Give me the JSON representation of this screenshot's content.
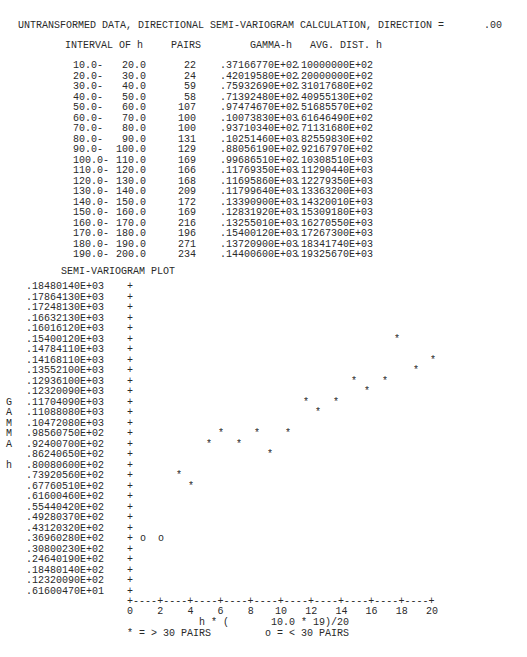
{
  "header": {
    "title": "UNTRANSFORMED DATA, DIRECTIONAL SEMI-VARIOGRAM CALCULATION, DIRECTION =",
    "direction": ".00"
  },
  "table": {
    "columns": [
      "INTERVAL OF h",
      "PAIRS",
      "GAMMA-h",
      "AVG. DIST. h"
    ],
    "rows": [
      {
        "from": "10.0-",
        "to": "20.0",
        "pairs": "22",
        "gamma": ".37166770E+02",
        "dist": ".10000000E+02"
      },
      {
        "from": "20.0-",
        "to": "30.0",
        "pairs": "24",
        "gamma": ".42019580E+02",
        "dist": ".20000000E+02"
      },
      {
        "from": "30.0-",
        "to": "40.0",
        "pairs": "59",
        "gamma": ".75932690E+02",
        "dist": ".31017680E+02"
      },
      {
        "from": "40.0-",
        "to": "50.0",
        "pairs": "58",
        "gamma": ".71392480E+02",
        "dist": ".40955130E+02"
      },
      {
        "from": "50.0-",
        "to": "60.0",
        "pairs": "107",
        "gamma": ".97474670E+02",
        "dist": ".51685570E+02"
      },
      {
        "from": "60.0-",
        "to": "70.0",
        "pairs": "100",
        "gamma": ".10073830E+03",
        "dist": ".61646490E+02"
      },
      {
        "from": "70.0-",
        "to": "80.0",
        "pairs": "100",
        "gamma": ".93710340E+02",
        "dist": ".71131680E+02"
      },
      {
        "from": "80.0-",
        "to": "90.0",
        "pairs": "131",
        "gamma": ".10251460E+03",
        "dist": ".82559830E+02"
      },
      {
        "from": "90.0-",
        "to": "100.0",
        "pairs": "129",
        "gamma": ".88056190E+02",
        "dist": ".92167970E+02"
      },
      {
        "from": "100.0-",
        "to": "110.0",
        "pairs": "169",
        "gamma": ".99686510E+02",
        "dist": ".10308510E+03"
      },
      {
        "from": "110.0-",
        "to": "120.0",
        "pairs": "166",
        "gamma": ".11769350E+03",
        "dist": ".11290440E+03"
      },
      {
        "from": "120.0-",
        "to": "130.0",
        "pairs": "168",
        "gamma": ".11695860E+03",
        "dist": ".12279350E+03"
      },
      {
        "from": "130.0-",
        "to": "140.0",
        "pairs": "209",
        "gamma": ".11799640E+03",
        "dist": ".13363200E+03"
      },
      {
        "from": "140.0-",
        "to": "150.0",
        "pairs": "172",
        "gamma": ".13390900E+03",
        "dist": ".14320010E+03"
      },
      {
        "from": "150.0-",
        "to": "160.0",
        "pairs": "169",
        "gamma": ".12831920E+03",
        "dist": ".15309180E+03"
      },
      {
        "from": "160.0-",
        "to": "170.0",
        "pairs": "216",
        "gamma": ".13255010E+03",
        "dist": ".16270550E+03"
      },
      {
        "from": "170.0-",
        "to": "180.0",
        "pairs": "196",
        "gamma": ".15400120E+03",
        "dist": ".17267300E+03"
      },
      {
        "from": "180.0-",
        "to": "190.0",
        "pairs": "271",
        "gamma": ".13720900E+03",
        "dist": ".18341740E+03"
      },
      {
        "from": "190.0-",
        "to": "200.0",
        "pairs": "234",
        "gamma": ".14400600E+03",
        "dist": ".19325670E+03"
      }
    ]
  },
  "plot": {
    "title": "SEMI-VARIOGRAM PLOT",
    "y_axis_letters": [
      "G",
      "A",
      "M",
      "M",
      "A",
      "",
      "h"
    ],
    "y_ticks": [
      ".18480140E+03",
      ".17864130E+03",
      ".17248130E+03",
      ".16632130E+03",
      ".16016120E+03",
      ".15400120E+03",
      ".14784110E+03",
      ".14168110E+03",
      ".13552100E+03",
      ".12936100E+03",
      ".12320090E+03",
      ".11704090E+03",
      ".11088080E+03",
      ".10472080E+03",
      ".98560750E+02",
      ".92400700E+02",
      ".86240650E+02",
      ".80080600E+02",
      ".73920560E+02",
      ".67760510E+02",
      ".61600460E+02",
      ".55440420E+02",
      ".49280370E+02",
      ".43120320E+02",
      ".36960280E+02",
      ".30800230E+02",
      ".24640190E+02",
      ".18480140E+02",
      ".12320090E+02",
      ".61600470E+01"
    ],
    "tick_mark": "+",
    "x_axis_line": "+----+----+----+----+----+----+----+----+----+----+",
    "x_ticks": [
      "0",
      "2",
      "4",
      "6",
      "8",
      "10",
      "12",
      "14",
      "16",
      "18",
      "20"
    ],
    "x_label": "h * (       10.0 * 19)/20",
    "legend_star": "* = > 30 PAIRS",
    "legend_o": "o = < 30 PAIRS",
    "points": [
      {
        "x": 143,
        "row": 24,
        "sym": "o"
      },
      {
        "x": 161,
        "row": 24,
        "sym": "o"
      },
      {
        "x": 179,
        "row": 18,
        "sym": "*"
      },
      {
        "x": 191,
        "row": 19,
        "sym": "*"
      },
      {
        "x": 209,
        "row": 15,
        "sym": "*"
      },
      {
        "x": 221,
        "row": 14,
        "sym": "*"
      },
      {
        "x": 239,
        "row": 15,
        "sym": "*"
      },
      {
        "x": 257,
        "row": 14,
        "sym": "*"
      },
      {
        "x": 270,
        "row": 16,
        "sym": "*"
      },
      {
        "x": 288,
        "row": 14,
        "sym": "*"
      },
      {
        "x": 306,
        "row": 11,
        "sym": "*"
      },
      {
        "x": 318,
        "row": 12,
        "sym": "*"
      },
      {
        "x": 336,
        "row": 11,
        "sym": "*"
      },
      {
        "x": 354,
        "row": 9,
        "sym": "*"
      },
      {
        "x": 367,
        "row": 10,
        "sym": "*"
      },
      {
        "x": 385,
        "row": 9,
        "sym": "*"
      },
      {
        "x": 397,
        "row": 5,
        "sym": "*"
      },
      {
        "x": 416,
        "row": 8,
        "sym": "*"
      },
      {
        "x": 433,
        "row": 7,
        "sym": "*"
      }
    ]
  },
  "chart_data": {
    "type": "scatter",
    "title": "SEMI-VARIOGRAM PLOT",
    "xlabel": "h * ( 10.0 * 19)/20",
    "ylabel": "GAMMA h",
    "xlim": [
      0,
      20
    ],
    "ylim": [
      6.16,
      184.8
    ],
    "x_ticks": [
      0,
      2,
      4,
      6,
      8,
      10,
      12,
      14,
      16,
      18,
      20
    ],
    "legend": [
      "* = > 30 PAIRS",
      "o = < 30 PAIRS"
    ],
    "series": [
      {
        "name": "> 30 pairs (*)",
        "x": [
          31.02,
          40.96,
          51.69,
          61.65,
          71.13,
          82.56,
          92.17,
          103.09,
          112.9,
          122.79,
          133.63,
          143.2,
          153.09,
          162.71,
          172.67,
          183.42,
          193.26
        ],
        "y": [
          75.93,
          71.39,
          97.47,
          100.74,
          93.71,
          102.51,
          88.06,
          99.69,
          117.69,
          116.96,
          118.0,
          133.91,
          128.32,
          132.55,
          154.0,
          137.21,
          144.01
        ]
      },
      {
        "name": "< 30 pairs (o)",
        "x": [
          10.0,
          20.0
        ],
        "y": [
          37.17,
          42.02
        ]
      }
    ],
    "grid": false
  }
}
